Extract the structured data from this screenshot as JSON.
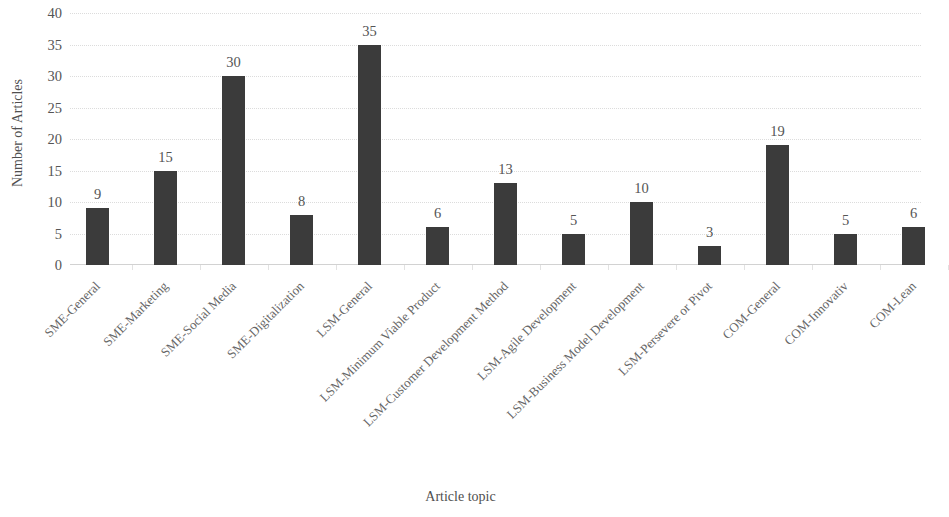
{
  "chart_data": {
    "type": "bar",
    "title": "",
    "xlabel": "Article topic",
    "ylabel": "Number of Articles",
    "ylim": [
      0,
      40
    ],
    "ytick_step": 5,
    "yticks": [
      0,
      5,
      10,
      15,
      20,
      25,
      30,
      35,
      40
    ],
    "grid": true,
    "legend": false,
    "bar_color": "#3b3b3b",
    "gridline_color": "#dcdcdc",
    "categories": [
      "SME-General",
      "SME-Marketing",
      "SME-Social Media",
      "SME-Digitalization",
      "LSM-General",
      "LSM-Minimum Viable Product",
      "LSM-Customer Development Method",
      "LSM-Agile Development",
      "LSM-Business Model Development",
      "LSM-Persevere or Pivot",
      "COM-General",
      "COM-Innovativ",
      "COM-Lean"
    ],
    "values": [
      9,
      15,
      30,
      8,
      35,
      6,
      13,
      5,
      10,
      3,
      19,
      5,
      6
    ],
    "data_labels": [
      "9",
      "15",
      "30",
      "8",
      "35",
      "6",
      "13",
      "5",
      "10",
      "3",
      "19",
      "5",
      "6"
    ]
  }
}
